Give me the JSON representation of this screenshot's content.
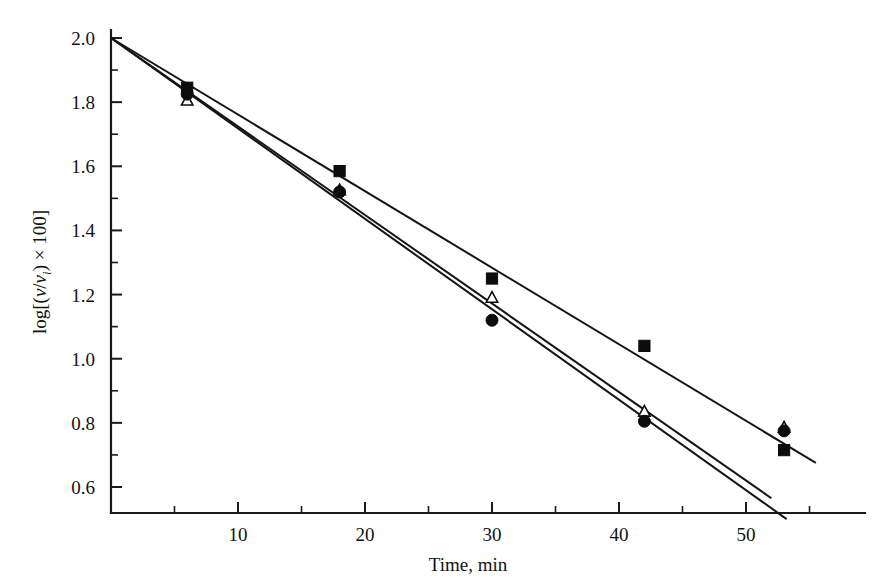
{
  "figure": {
    "name": "semilog-decay-plot",
    "background_color": "#ffffff",
    "ink_color": "#121212"
  },
  "chart_data": {
    "type": "scatter",
    "title": "",
    "subtitle": "",
    "xlabel": "Time, min",
    "ylabel": "log[(v/v_i) × 100]",
    "ylabel_parts": {
      "prefix": "log[(",
      "v1": "v",
      "slash": "/",
      "v2": "v",
      "v2_sub": "i",
      "suffix": ") × 100]"
    },
    "xlim": [
      0,
      56
    ],
    "ylim": [
      0.5,
      2.0
    ],
    "grid": false,
    "legend": "none",
    "x_ticks_major": [
      10,
      20,
      30,
      40,
      50
    ],
    "x_ticks_major_labels": [
      "10",
      "20",
      "30",
      "40",
      "50"
    ],
    "x_ticks_minor": [
      5,
      15,
      25,
      35,
      45,
      55
    ],
    "y_ticks_major": [
      0.6,
      0.8,
      1.0,
      1.2,
      1.4,
      1.6,
      1.8,
      2.0
    ],
    "y_ticks_major_labels": [
      "0.6",
      "0.8",
      "1.0",
      "1.2",
      "1.4",
      "1.6",
      "1.8",
      "2.0"
    ],
    "y_ticks_minor": [
      0.7,
      0.9,
      1.1,
      1.3,
      1.5,
      1.7,
      1.9
    ],
    "series": [
      {
        "name": "series-square",
        "marker": "filled-square",
        "x": [
          6,
          18,
          30,
          42,
          53
        ],
        "y": [
          1.845,
          1.585,
          1.25,
          1.04,
          0.715
        ],
        "fit_line": {
          "x0": 0,
          "y0": 2.0,
          "x1": 55.5,
          "y1": 0.675
        }
      },
      {
        "name": "series-triangle",
        "marker": "open-triangle",
        "x": [
          6,
          18,
          30,
          42,
          53
        ],
        "y": [
          1.805,
          1.525,
          1.19,
          0.835,
          0.785
        ],
        "fit_line": {
          "x0": 0,
          "y0": 2.0,
          "x1": 52.0,
          "y1": 0.565
        }
      },
      {
        "name": "series-circle",
        "marker": "filled-circle",
        "x": [
          6,
          18,
          30,
          42,
          53
        ],
        "y": [
          1.825,
          1.52,
          1.12,
          0.805,
          0.775
        ],
        "fit_line": {
          "x0": 0,
          "y0": 2.0,
          "x1": 53.2,
          "y1": 0.5
        }
      }
    ]
  }
}
